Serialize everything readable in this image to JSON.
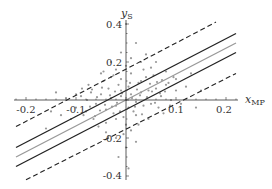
{
  "chart_data": {
    "type": "scatter",
    "title": "",
    "xlabel": "x",
    "xlabel_sub": "MP",
    "ylabel": "y",
    "ylabel_sub": "S",
    "xlim": [
      -0.22,
      0.22
    ],
    "ylim": [
      -0.42,
      0.42
    ],
    "x_ticks": [
      -0.2,
      -0.1,
      0.1,
      0.2
    ],
    "x_tick_labels": [
      "-0.2",
      "-0.1",
      "0.1",
      "0.2"
    ],
    "y_ticks": [
      -0.4,
      -0.2,
      0.2,
      0.4
    ],
    "y_tick_labels": [
      "-0.4",
      "-0.2",
      "0.2",
      "0.4"
    ],
    "grid": false,
    "legend": null,
    "lines": [
      {
        "name": "upper confidence bound",
        "style": "solid",
        "color": "#222222",
        "x": [
          -0.22,
          0.22
        ],
        "y": [
          -0.25,
          0.35
        ]
      },
      {
        "name": "regression line",
        "style": "solid",
        "color": "#999999",
        "x": [
          -0.22,
          0.22
        ],
        "y": [
          -0.3,
          0.3
        ]
      },
      {
        "name": "lower confidence bound",
        "style": "solid",
        "color": "#222222",
        "x": [
          -0.22,
          0.22
        ],
        "y": [
          -0.35,
          0.25
        ]
      },
      {
        "name": "upper prediction bound",
        "style": "dashed",
        "color": "#222222",
        "x": [
          -0.22,
          0.18
        ],
        "y": [
          -0.14,
          0.41
        ]
      },
      {
        "name": "lower prediction bound",
        "style": "dashed",
        "color": "#222222",
        "x": [
          -0.2,
          0.22
        ],
        "y": [
          -0.42,
          0.14
        ]
      }
    ],
    "scatter": {
      "name": "observations",
      "color": "#999999",
      "points": [
        [
          -0.06,
          -0.02
        ],
        [
          -0.05,
          0.03
        ],
        [
          -0.04,
          -0.05
        ],
        [
          -0.03,
          0.01
        ],
        [
          -0.02,
          -0.03
        ],
        [
          -0.01,
          0.02
        ],
        [
          0.0,
          0.0
        ],
        [
          0.01,
          0.03
        ],
        [
          0.02,
          -0.01
        ],
        [
          0.03,
          0.04
        ],
        [
          -0.035,
          0.06
        ],
        [
          -0.025,
          -0.07
        ],
        [
          -0.015,
          0.08
        ],
        [
          -0.005,
          -0.09
        ],
        [
          0.005,
          0.07
        ],
        [
          0.015,
          -0.06
        ],
        [
          0.025,
          0.09
        ],
        [
          0.035,
          -0.03
        ],
        [
          0.045,
          0.05
        ],
        [
          0.05,
          -0.02
        ],
        [
          -0.045,
          0.1
        ],
        [
          -0.04,
          -0.12
        ],
        [
          -0.03,
          0.12
        ],
        [
          -0.02,
          -0.1
        ],
        [
          -0.01,
          0.11
        ],
        [
          0.0,
          -0.13
        ],
        [
          0.01,
          0.14
        ],
        [
          0.02,
          -0.08
        ],
        [
          0.03,
          0.1
        ],
        [
          0.04,
          0.12
        ],
        [
          0.06,
          0.06
        ],
        [
          0.07,
          0.02
        ],
        [
          0.065,
          -0.04
        ],
        [
          0.08,
          0.08
        ],
        [
          0.09,
          0.0
        ],
        [
          0.055,
          0.13
        ],
        [
          0.075,
          -0.07
        ],
        [
          -0.07,
          0.04
        ],
        [
          -0.08,
          -0.06
        ],
        [
          -0.065,
          -0.1
        ],
        [
          -0.09,
          0.02
        ],
        [
          -0.1,
          -0.04
        ],
        [
          -0.075,
          0.08
        ],
        [
          -0.055,
          -0.14
        ],
        [
          -0.05,
          0.14
        ],
        [
          0.0,
          0.18
        ],
        [
          0.01,
          0.22
        ],
        [
          -0.01,
          0.25
        ],
        [
          0.03,
          0.2
        ],
        [
          0.02,
          0.3
        ],
        [
          0.04,
          0.24
        ],
        [
          0.05,
          0.17
        ],
        [
          0.06,
          0.2
        ],
        [
          0.08,
          0.15
        ],
        [
          -0.02,
          0.16
        ],
        [
          0.0,
          0.4
        ],
        [
          -0.03,
          0.2
        ],
        [
          0.1,
          0.05
        ],
        [
          0.11,
          -0.02
        ],
        [
          0.095,
          0.12
        ],
        [
          -0.005,
          -0.18
        ],
        [
          -0.02,
          -0.2
        ],
        [
          0.01,
          -0.16
        ],
        [
          -0.04,
          -0.17
        ],
        [
          0.02,
          -0.22
        ],
        [
          0.0,
          -0.25
        ],
        [
          -0.015,
          -0.3
        ],
        [
          0.005,
          -0.36
        ],
        [
          -0.11,
          -0.1
        ],
        [
          -0.12,
          0.01
        ],
        [
          -0.01,
          0.05
        ],
        [
          0.005,
          -0.04
        ],
        [
          -0.008,
          0.035
        ],
        [
          0.012,
          0.01
        ],
        [
          -0.018,
          -0.015
        ],
        [
          0.022,
          0.055
        ],
        [
          0.028,
          0.025
        ],
        [
          -0.028,
          -0.035
        ],
        [
          0.008,
          0.09
        ],
        [
          -0.012,
          -0.06
        ],
        [
          0.018,
          -0.035
        ],
        [
          -0.022,
          0.045
        ],
        [
          0.032,
          -0.075
        ],
        [
          -0.032,
          0.025
        ],
        [
          0.042,
          0.015
        ],
        [
          -0.042,
          -0.025
        ],
        [
          0.048,
          0.085
        ],
        [
          -0.048,
          0.065
        ],
        [
          0.052,
          0.045
        ],
        [
          -0.052,
          -0.055
        ],
        [
          0.058,
          -0.015
        ],
        [
          -0.058,
          0.015
        ],
        [
          0.062,
          0.095
        ],
        [
          -0.062,
          -0.085
        ],
        [
          0.068,
          0.035
        ],
        [
          -0.068,
          0.055
        ],
        [
          0.072,
          0.105
        ],
        [
          -0.072,
          -0.035
        ],
        [
          0.078,
          0.045
        ],
        [
          -0.078,
          0.0
        ],
        [
          0.085,
          0.09
        ],
        [
          -0.085,
          -0.08
        ],
        [
          0.088,
          -0.03
        ],
        [
          -0.088,
          0.06
        ],
        [
          0.1,
          0.11
        ],
        [
          -0.1,
          0.03
        ],
        [
          0.12,
          0.07
        ],
        [
          -0.13,
          -0.08
        ],
        [
          0.13,
          0.14
        ],
        [
          -0.15,
          -0.06
        ],
        [
          -0.16,
          -0.15
        ],
        [
          -0.14,
          0.04
        ],
        [
          0.15,
          0.05
        ],
        [
          0.14,
          -0.04
        ],
        [
          0.035,
          0.16
        ],
        [
          -0.035,
          -0.19
        ],
        [
          0.045,
          -0.1
        ],
        [
          -0.045,
          0.15
        ],
        [
          0.025,
          -0.13
        ],
        [
          -0.025,
          0.13
        ]
      ]
    }
  },
  "axes": {
    "x_label": "x",
    "x_label_sub": "MP",
    "y_label": "y",
    "y_label_sub": "S",
    "x_tick_labels": [
      "-0.2",
      "-0.1",
      "0.1",
      "0.2"
    ],
    "y_tick_labels": [
      "0.4",
      "0.2",
      "-0.2",
      "-0.4"
    ]
  }
}
